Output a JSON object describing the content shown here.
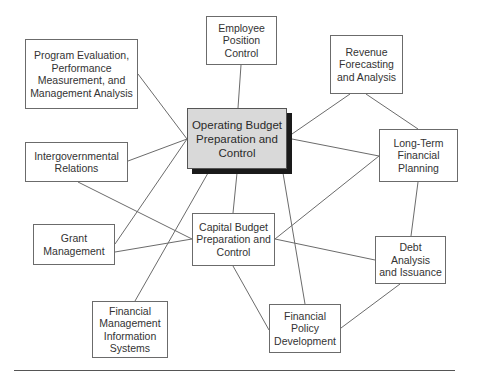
{
  "diagram": {
    "central": {
      "id": "operating",
      "label": "Operating Budget\nPreparation and\nControl"
    },
    "nodes": [
      {
        "id": "employee",
        "label": "Employee\nPosition\nControl"
      },
      {
        "id": "program",
        "label": "Program Evaluation,\nPerformance\nMeasurement, and\nManagement Analysis"
      },
      {
        "id": "revenue",
        "label": "Revenue\nForecasting\nand Analysis"
      },
      {
        "id": "intergov",
        "label": "Intergovernmental\nRelations"
      },
      {
        "id": "longterm",
        "label": "Long-Term\nFinancial\nPlanning"
      },
      {
        "id": "grant",
        "label": "Grant\nManagement"
      },
      {
        "id": "capital",
        "label": "Capital Budget\nPreparation and\nControl"
      },
      {
        "id": "debt",
        "label": "Debt Analysis\nand Issuance"
      },
      {
        "id": "fmis",
        "label": "Financial\nManagement\nInformation\nSystems"
      },
      {
        "id": "policy",
        "label": "Financial\nPolicy\nDevelopment"
      }
    ],
    "edges": [
      [
        "employee",
        "operating"
      ],
      [
        "program",
        "operating"
      ],
      [
        "intergov",
        "operating"
      ],
      [
        "grant",
        "operating"
      ],
      [
        "operating",
        "fmis"
      ],
      [
        "operating",
        "capital"
      ],
      [
        "operating",
        "policy"
      ],
      [
        "operating",
        "revenue"
      ],
      [
        "operating",
        "longterm"
      ],
      [
        "revenue",
        "longterm"
      ],
      [
        "longterm",
        "debt"
      ],
      [
        "longterm",
        "capital"
      ],
      [
        "capital",
        "debt"
      ],
      [
        "debt",
        "policy"
      ],
      [
        "capital",
        "policy"
      ],
      [
        "intergov",
        "capital"
      ],
      [
        "grant",
        "capital"
      ]
    ]
  }
}
